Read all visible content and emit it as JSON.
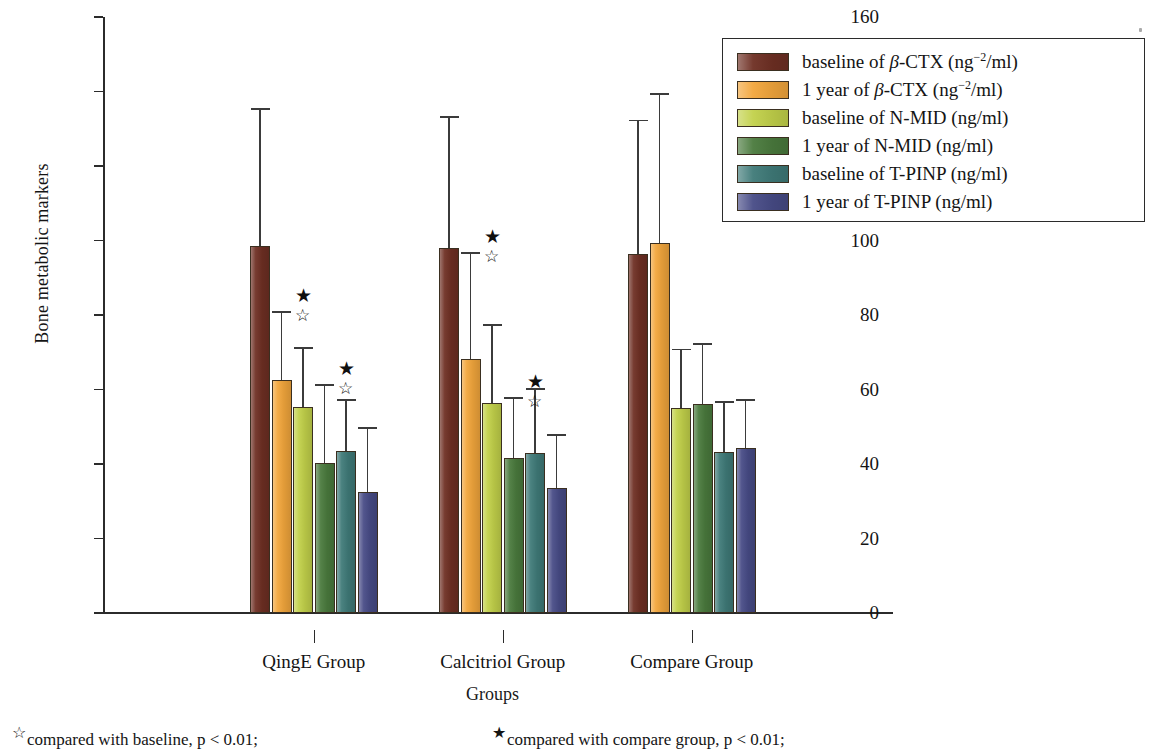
{
  "axes": {
    "y_title": "Bone metabolic markers",
    "x_title": "Groups",
    "y_ticks": [
      "0",
      "20",
      "40",
      "60",
      "80",
      "100",
      "120",
      "140",
      "160"
    ]
  },
  "legend": {
    "items": [
      {
        "label": "baseline of β-CTX (ng⁻²/ml)",
        "color": "#6e2f23",
        "name": "baseline-beta-ctx"
      },
      {
        "label": "1 year of β-CTX (ng⁻²/ml)",
        "color": "#f2a63c",
        "name": "year1-beta-ctx"
      },
      {
        "label": "baseline of N-MID (ng/ml)",
        "color": "#c2d14a",
        "name": "baseline-n-mid"
      },
      {
        "label": "1 year of N-MID (ng/ml)",
        "color": "#4a7a3d",
        "name": "year1-n-mid"
      },
      {
        "label": "baseline of T-PINP (ng/ml)",
        "color": "#3f7a78",
        "name": "baseline-t-pinp"
      },
      {
        "label": "1 year of T-PINP (ng/ml)",
        "color": "#474b86",
        "name": "year1-t-pinp"
      }
    ]
  },
  "footnotes": {
    "open_star": "☆",
    "open_text": "compared with baseline, p < 0.01;",
    "filled_star": "★",
    "filled_text": "compared with compare group, p < 0.01;"
  },
  "chart_data": {
    "type": "bar",
    "title": "",
    "xlabel": "Groups",
    "ylabel": "Bone metabolic markers",
    "ylim": [
      0,
      160
    ],
    "ytick_step": 20,
    "grid": false,
    "legend_position": "top-right",
    "categories": [
      "QingE Group",
      "Calcitriol Group",
      "Compare Group"
    ],
    "series": [
      {
        "name": "baseline of β-CTX (ng⁻²/ml)",
        "color": "#6e2f23",
        "values": [
          98.5,
          98.0,
          96.5
        ],
        "err_high": [
          135.0,
          133.0,
          132.0
        ]
      },
      {
        "name": "1 year of β-CTX (ng⁻²/ml)",
        "color": "#f2a63c",
        "values": [
          62.5,
          68.3,
          99.3
        ],
        "err_high": [
          80.5,
          96.5,
          139.0
        ]
      },
      {
        "name": "baseline of N-MID (ng/ml)",
        "color": "#c2d14a",
        "values": [
          55.3,
          56.3,
          55.0
        ],
        "err_high": [
          71.0,
          77.0,
          70.5
        ]
      },
      {
        "name": "1 year of N-MID (ng/ml)",
        "color": "#4a7a3d",
        "values": [
          40.3,
          41.5,
          56.0
        ],
        "err_high": [
          61.0,
          57.5,
          72.0
        ]
      },
      {
        "name": "baseline of T-PINP (ng/ml)",
        "color": "#3f7a78",
        "values": [
          43.5,
          43.0,
          43.2
        ],
        "err_high": [
          57.0,
          60.0,
          56.5
        ]
      },
      {
        "name": "1 year of T-PINP (ng/ml)",
        "color": "#474b86",
        "values": [
          32.5,
          33.5,
          44.2
        ],
        "err_high": [
          49.5,
          47.5,
          57.0
        ]
      }
    ],
    "annotations": [
      {
        "group": "QingE Group",
        "series_index": 1,
        "marks": [
          "★",
          "☆"
        ]
      },
      {
        "group": "QingE Group",
        "series_index": 3,
        "marks": [
          "★",
          "☆"
        ]
      },
      {
        "group": "Calcitriol Group",
        "series_index": 1,
        "marks": [
          "★",
          "☆"
        ]
      },
      {
        "group": "Calcitriol Group",
        "series_index": 3,
        "marks": [
          "★",
          "☆"
        ]
      }
    ]
  }
}
